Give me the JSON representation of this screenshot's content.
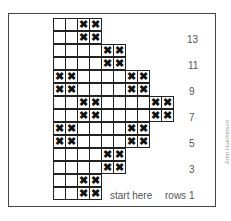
{
  "chart_data": {
    "type": "knitting-chart",
    "columns_max": 10,
    "rows": [
      {
        "row": 14,
        "cols": 4,
        "x": [
          3,
          4
        ]
      },
      {
        "row": 13,
        "cols": 4,
        "x": [
          3,
          4
        ]
      },
      {
        "row": 12,
        "cols": 6,
        "x": [
          5,
          6
        ]
      },
      {
        "row": 11,
        "cols": 6,
        "x": [
          5,
          6
        ]
      },
      {
        "row": 10,
        "cols": 8,
        "x": [
          1,
          2,
          7,
          8
        ]
      },
      {
        "row": 9,
        "cols": 8,
        "x": [
          1,
          2,
          7,
          8
        ]
      },
      {
        "row": 8,
        "cols": 10,
        "x": [
          3,
          4,
          9,
          10
        ]
      },
      {
        "row": 7,
        "cols": 10,
        "x": [
          3,
          4,
          9,
          10
        ]
      },
      {
        "row": 6,
        "cols": 8,
        "x": [
          1,
          2,
          7,
          8
        ]
      },
      {
        "row": 5,
        "cols": 8,
        "x": [
          1,
          2,
          7,
          8
        ]
      },
      {
        "row": 4,
        "cols": 6,
        "x": [
          5,
          6
        ]
      },
      {
        "row": 3,
        "cols": 6,
        "x": [
          5,
          6
        ]
      },
      {
        "row": 2,
        "cols": 4,
        "x": [
          3,
          4
        ]
      },
      {
        "row": 1,
        "cols": 4,
        "x": [
          3,
          4
        ]
      }
    ],
    "mark_symbol": "✖"
  },
  "labels": {
    "row13": "13",
    "row11": "11",
    "row9": "9",
    "row7": "7",
    "row5": "5",
    "row3": "3",
    "start": "start here",
    "rows1": "rows 1"
  },
  "credit": "John Hutchinson"
}
